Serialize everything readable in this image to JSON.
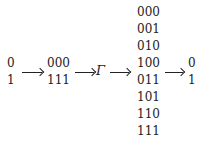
{
  "diagram": {
    "input": [
      "0",
      "1"
    ],
    "encoded": [
      "000",
      "111"
    ],
    "channel": "Γ",
    "received": [
      "000",
      "001",
      "010",
      "100",
      "011",
      "101",
      "110",
      "111"
    ],
    "decoded": [
      "0",
      "1"
    ]
  }
}
